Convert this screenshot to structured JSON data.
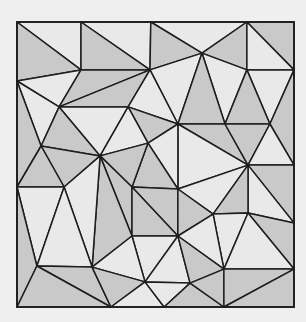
{
  "diagram": {
    "title": "",
    "colors": {
      "dark": "#c9c9c9",
      "light": "#e9e9e9",
      "stroke": "#1e1e1e",
      "background": "#efefef"
    },
    "vertices": {
      "TL": [
        0,
        0
      ],
      "T1": [
        0.231,
        0
      ],
      "T2": [
        0.483,
        0
      ],
      "T3": [
        0.83,
        0
      ],
      "TR": [
        1,
        0
      ],
      "A": [
        0.231,
        0.168
      ],
      "B": [
        0.48,
        0.168
      ],
      "C": [
        0.668,
        0.109
      ],
      "D": [
        0.83,
        0.168
      ],
      "E": [
        1,
        0.168
      ],
      "L1": [
        0,
        0.207
      ],
      "F": [
        0.152,
        0.298
      ],
      "G": [
        0.401,
        0.298
      ],
      "H": [
        0.581,
        0.358
      ],
      "I": [
        0.751,
        0.358
      ],
      "J": [
        0.913,
        0.358
      ],
      "K": [
        0.087,
        0.435
      ],
      "M": [
        0.3,
        0.47
      ],
      "N": [
        0.473,
        0.425
      ],
      "O": [
        0.834,
        0.502
      ],
      "P": [
        1,
        0.502
      ],
      "L2": [
        0,
        0.579
      ],
      "Q": [
        0.17,
        0.579
      ],
      "S": [
        0.415,
        0.579
      ],
      "R": [
        0.581,
        0.586
      ],
      "W": [
        0.708,
        0.674
      ],
      "X": [
        0.834,
        0.67
      ],
      "Y": [
        1,
        0.705
      ],
      "U": [
        0.415,
        0.751
      ],
      "V": [
        0.581,
        0.751
      ],
      "Q2": [
        0.072,
        0.856
      ],
      "R2": [
        0.271,
        0.86
      ],
      "AB": [
        0.462,
        0.912
      ],
      "AC": [
        0.625,
        0.916
      ],
      "Z": [
        0.747,
        0.867
      ],
      "AA": [
        1,
        0.867
      ],
      "BL": [
        0,
        1
      ],
      "B1": [
        0.339,
        1
      ],
      "B2": [
        0.531,
        1
      ],
      "B3": [
        0.747,
        1
      ],
      "BR": [
        1,
        1
      ]
    },
    "triangles": [
      {
        "v": [
          "TL",
          "T1",
          "A"
        ],
        "shade": "light"
      },
      {
        "v": [
          "TL",
          "A",
          "L1"
        ],
        "shade": "dark"
      },
      {
        "v": [
          "T1",
          "T2",
          "B"
        ],
        "shade": "light"
      },
      {
        "v": [
          "T1",
          "B",
          "A"
        ],
        "shade": "dark"
      },
      {
        "v": [
          "T2",
          "T3",
          "C"
        ],
        "shade": "light"
      },
      {
        "v": [
          "T2",
          "C",
          "B"
        ],
        "shade": "dark"
      },
      {
        "v": [
          "T3",
          "C",
          "D"
        ],
        "shade": "dark"
      },
      {
        "v": [
          "T3",
          "TR",
          "E"
        ],
        "shade": "dark"
      },
      {
        "v": [
          "T3",
          "E",
          "D"
        ],
        "shade": "light"
      },
      {
        "v": [
          "L1",
          "A",
          "F"
        ],
        "shade": "light"
      },
      {
        "v": [
          "A",
          "B",
          "F"
        ],
        "shade": "dark"
      },
      {
        "v": [
          "F",
          "B",
          "G"
        ],
        "shade": "dark"
      },
      {
        "v": [
          "B",
          "C",
          "H"
        ],
        "shade": "light"
      },
      {
        "v": [
          "B",
          "H",
          "G"
        ],
        "shade": "light"
      },
      {
        "v": [
          "C",
          "D",
          "I"
        ],
        "shade": "light"
      },
      {
        "v": [
          "C",
          "I",
          "H"
        ],
        "shade": "dark"
      },
      {
        "v": [
          "D",
          "E",
          "J"
        ],
        "shade": "light"
      },
      {
        "v": [
          "D",
          "J",
          "I"
        ],
        "shade": "dark"
      },
      {
        "v": [
          "E",
          "P",
          "J"
        ],
        "shade": "dark"
      },
      {
        "v": [
          "L1",
          "F",
          "K"
        ],
        "shade": "light"
      },
      {
        "v": [
          "L1",
          "K",
          "L2"
        ],
        "shade": "dark"
      },
      {
        "v": [
          "F",
          "G",
          "M"
        ],
        "shade": "light"
      },
      {
        "v": [
          "F",
          "M",
          "K"
        ],
        "shade": "dark"
      },
      {
        "v": [
          "G",
          "H",
          "N"
        ],
        "shade": "dark"
      },
      {
        "v": [
          "G",
          "N",
          "M"
        ],
        "shade": "light"
      },
      {
        "v": [
          "H",
          "I",
          "O"
        ],
        "shade": "dark"
      },
      {
        "v": [
          "H",
          "O",
          "R"
        ],
        "shade": "light"
      },
      {
        "v": [
          "H",
          "R",
          "N"
        ],
        "shade": "light"
      },
      {
        "v": [
          "I",
          "J",
          "O"
        ],
        "shade": "dark"
      },
      {
        "v": [
          "J",
          "P",
          "O"
        ],
        "shade": "light"
      },
      {
        "v": [
          "K",
          "M",
          "Q"
        ],
        "shade": "dark"
      },
      {
        "v": [
          "K",
          "Q",
          "L2"
        ],
        "shade": "dark"
      },
      {
        "v": [
          "N",
          "R",
          "S"
        ],
        "shade": "dark"
      },
      {
        "v": [
          "N",
          "S",
          "M"
        ],
        "shade": "dark"
      },
      {
        "v": [
          "M",
          "S",
          "U"
        ],
        "shade": "dark"
      },
      {
        "v": [
          "M",
          "U",
          "R2"
        ],
        "shade": "dark"
      },
      {
        "v": [
          "M",
          "R2",
          "Q"
        ],
        "shade": "light"
      },
      {
        "v": [
          "L2",
          "Q",
          "Q2"
        ],
        "shade": "light"
      },
      {
        "v": [
          "L2",
          "Q2",
          "BL"
        ],
        "shade": "dark"
      },
      {
        "v": [
          "Q",
          "R2",
          "Q2"
        ],
        "shade": "light"
      },
      {
        "v": [
          "S",
          "R",
          "V"
        ],
        "shade": "dark"
      },
      {
        "v": [
          "S",
          "V",
          "U"
        ],
        "shade": "dark"
      },
      {
        "v": [
          "R",
          "O",
          "W"
        ],
        "shade": "light"
      },
      {
        "v": [
          "R",
          "W",
          "V"
        ],
        "shade": "dark"
      },
      {
        "v": [
          "O",
          "P",
          "Y"
        ],
        "shade": "dark"
      },
      {
        "v": [
          "O",
          "Y",
          "X"
        ],
        "shade": "light"
      },
      {
        "v": [
          "O",
          "X",
          "W"
        ],
        "shade": "dark"
      },
      {
        "v": [
          "W",
          "X",
          "Z"
        ],
        "shade": "light"
      },
      {
        "v": [
          "W",
          "Z",
          "V"
        ],
        "shade": "light"
      },
      {
        "v": [
          "X",
          "Y",
          "AA"
        ],
        "shade": "dark"
      },
      {
        "v": [
          "X",
          "AA",
          "Z"
        ],
        "shade": "light"
      },
      {
        "v": [
          "U",
          "V",
          "AB"
        ],
        "shade": "light"
      },
      {
        "v": [
          "V",
          "AC",
          "AB"
        ],
        "shade": "light"
      },
      {
        "v": [
          "V",
          "Z",
          "AC"
        ],
        "shade": "dark"
      },
      {
        "v": [
          "U",
          "AB",
          "R2"
        ],
        "shade": "light"
      },
      {
        "v": [
          "Q2",
          "R2",
          "B1"
        ],
        "shade": "dark"
      },
      {
        "v": [
          "Q2",
          "B1",
          "BL"
        ],
        "shade": "dark"
      },
      {
        "v": [
          "R2",
          "AB",
          "B1"
        ],
        "shade": "dark"
      },
      {
        "v": [
          "AB",
          "B2",
          "B1"
        ],
        "shade": "light"
      },
      {
        "v": [
          "AB",
          "AC",
          "B2"
        ],
        "shade": "light"
      },
      {
        "v": [
          "AC",
          "B3",
          "B2"
        ],
        "shade": "dark"
      },
      {
        "v": [
          "AC",
          "Z",
          "B3"
        ],
        "shade": "dark"
      },
      {
        "v": [
          "Z",
          "AA",
          "B3"
        ],
        "shade": "dark"
      },
      {
        "v": [
          "AA",
          "BR",
          "B3"
        ],
        "shade": "dark"
      }
    ]
  }
}
